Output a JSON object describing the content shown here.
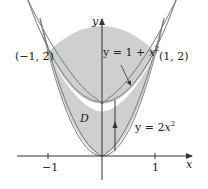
{
  "figure": {
    "axes": {
      "x_label": "x",
      "y_label": "y",
      "x_ticks": [
        {
          "value": -1,
          "label": "−1"
        },
        {
          "value": 1,
          "label": "1"
        }
      ]
    },
    "curves": {
      "upper": {
        "label_prefix": "y = 1 + ",
        "label_var": "x",
        "label_exp": "2"
      },
      "lower": {
        "label_prefix": "y = 2",
        "label_var": "x",
        "label_exp": "2"
      }
    },
    "points": [
      {
        "label": "(−1, 2)",
        "x": -1,
        "y": 2
      },
      {
        "label": "(1, 2)",
        "x": 1,
        "y": 2
      }
    ],
    "region_label": "D",
    "colors": {
      "region_fill": "#cfcfcf",
      "curve_stroke": "#7a7a7a",
      "axis_stroke": "#333333",
      "background": "#ffffff"
    }
  }
}
